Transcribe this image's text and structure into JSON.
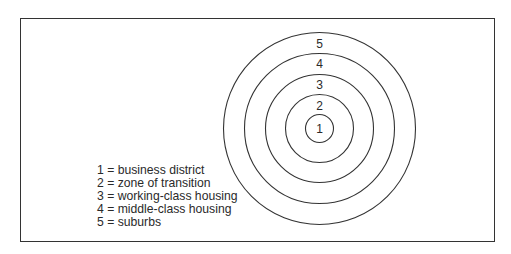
{
  "diagram": {
    "type": "concentric-zone-model",
    "zones": [
      {
        "number": "1",
        "label": "business district"
      },
      {
        "number": "2",
        "label": "zone of transition"
      },
      {
        "number": "3",
        "label": "working-class housing"
      },
      {
        "number": "4",
        "label": "middle-class housing"
      },
      {
        "number": "5",
        "label": "suburbs"
      }
    ],
    "legend": [
      "1 = business district",
      "2 = zone of transition",
      "3 = working-class housing",
      "4 = middle-class housing",
      "5 = suburbs"
    ],
    "colors": {
      "line": "#333333",
      "text": "#2a2a2a",
      "background": "#ffffff"
    }
  }
}
